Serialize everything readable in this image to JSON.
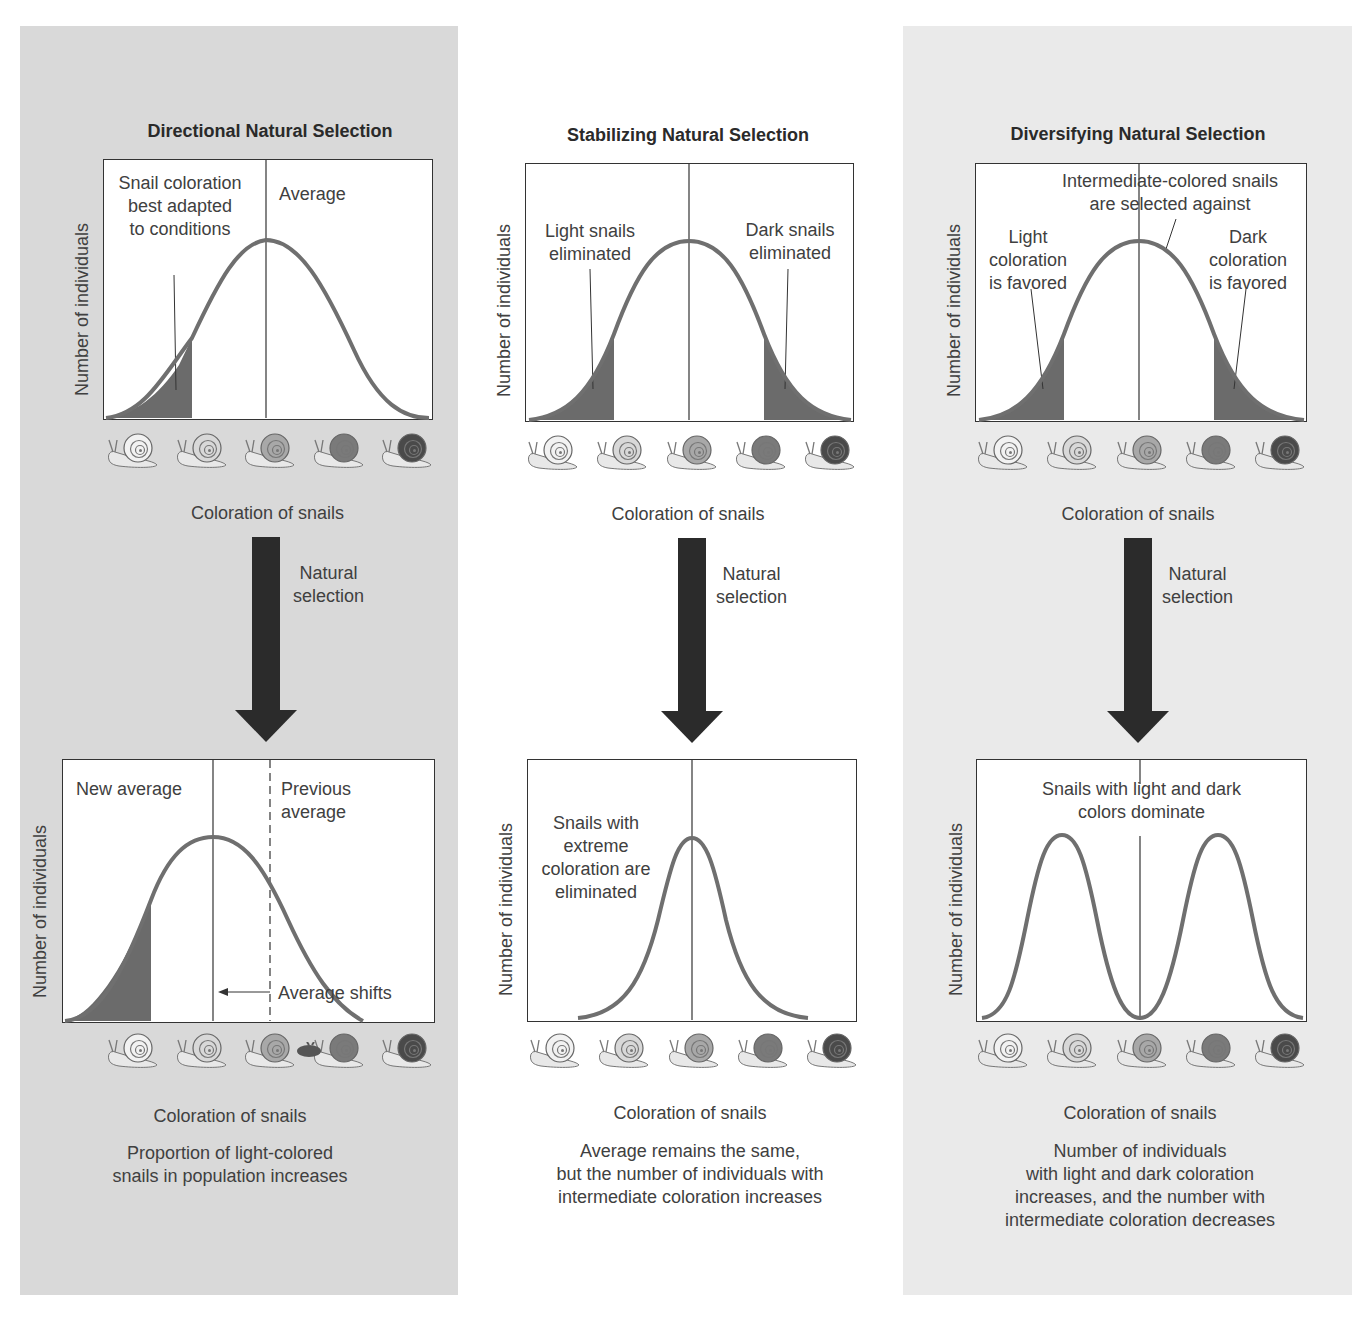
{
  "colors": {
    "panel_left_bg": "#d9d9d9",
    "panel_middle_bg": "#ffffff",
    "panel_right_bg": "#eaeaea",
    "curve": "#6f6f6f",
    "shaded_area": "#6b6b6b",
    "arrow": "#2b2b2b",
    "snail_shades": [
      "#f2f2f2",
      "#d8d8d8",
      "#a8a8a8",
      "#7a7a7a",
      "#4a4a4a"
    ]
  },
  "common": {
    "y_axis_label": "Number of individuals",
    "x_axis_label": "Coloration of snails",
    "arrow_label_line1": "Natural",
    "arrow_label_line2": "selection",
    "snail_icons": [
      "snail-lightest",
      "snail-light",
      "snail-intermediate",
      "snail-dark",
      "snail-darkest"
    ]
  },
  "panels": [
    {
      "title": "Directional Natural Selection",
      "before": {
        "annotations": {
          "selected": [
            "Snail coloration",
            "best adapted",
            "to conditions"
          ],
          "mean": "Average"
        }
      },
      "after": {
        "annotations": {
          "new_mean": "New average",
          "previous_mean": [
            "Previous",
            "average"
          ],
          "shift": "Average shifts"
        }
      },
      "caption": [
        "Proportion of light-colored",
        "snails in population increases"
      ]
    },
    {
      "title": "Stabilizing Natural Selection",
      "before": {
        "annotations": {
          "left": [
            "Light snails",
            "eliminated"
          ],
          "right": [
            "Dark snails",
            "eliminated"
          ]
        }
      },
      "after": {
        "annotations": {
          "center": [
            "Snails with",
            "extreme",
            "coloration are",
            "eliminated"
          ]
        }
      },
      "caption": [
        "Average remains the same,",
        "but the number of individuals with",
        "intermediate coloration increases"
      ]
    },
    {
      "title": "Diversifying Natural Selection",
      "before": {
        "annotations": {
          "top": [
            "Intermediate-colored snails",
            "are selected against"
          ],
          "left": [
            "Light",
            "coloration",
            "is favored"
          ],
          "right": [
            "Dark",
            "coloration",
            "is favored"
          ]
        }
      },
      "after": {
        "annotations": {
          "top": [
            "Snails with light and dark",
            "colors dominate"
          ]
        }
      },
      "caption": [
        "Number of individuals",
        "with light and dark coloration",
        "increases, and the number with",
        "intermediate coloration decreases"
      ]
    }
  ],
  "chart_data": [
    {
      "type": "line",
      "title": "Directional Natural Selection — before",
      "xlabel": "Coloration of snails",
      "ylabel": "Number of individuals",
      "shape": "unimodal centered",
      "mean_position": 0.5,
      "shaded_region": [
        0.0,
        0.17
      ]
    },
    {
      "type": "line",
      "title": "Directional Natural Selection — after",
      "xlabel": "Coloration of snails",
      "ylabel": "Number of individuals",
      "shape": "unimodal shifted left",
      "mean_position": 0.4,
      "previous_mean_position": 0.57,
      "shaded_region": [
        0.0,
        0.23
      ]
    },
    {
      "type": "line",
      "title": "Stabilizing Natural Selection — before",
      "xlabel": "Coloration of snails",
      "ylabel": "Number of individuals",
      "shape": "unimodal centered",
      "mean_position": 0.5,
      "shaded_regions": [
        [
          0.0,
          0.23
        ],
        [
          0.77,
          1.0
        ]
      ]
    },
    {
      "type": "line",
      "title": "Stabilizing Natural Selection — after",
      "xlabel": "Coloration of snails",
      "ylabel": "Number of individuals",
      "shape": "narrow unimodal centered",
      "mean_position": 0.5
    },
    {
      "type": "line",
      "title": "Diversifying Natural Selection — before",
      "xlabel": "Coloration of snails",
      "ylabel": "Number of individuals",
      "shape": "unimodal centered",
      "mean_position": 0.5,
      "shaded_regions": [
        [
          0.0,
          0.23
        ],
        [
          0.77,
          1.0
        ]
      ]
    },
    {
      "type": "line",
      "title": "Diversifying Natural Selection — after",
      "xlabel": "Coloration of snails",
      "ylabel": "Number of individuals",
      "shape": "bimodal",
      "peaks": [
        0.26,
        0.74
      ],
      "center_line": 0.5
    }
  ]
}
